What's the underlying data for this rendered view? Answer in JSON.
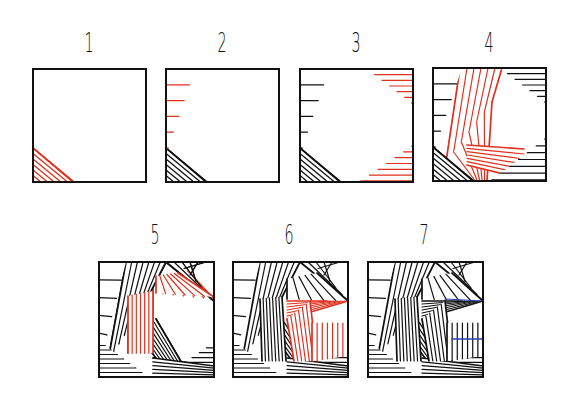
{
  "colors": {
    "ink": "#111111",
    "new_stroke": "#e0301e",
    "accent_blue": "#2a3fb0",
    "background": "#ffffff"
  },
  "steps": [
    {
      "label": "1",
      "box": [
        32,
        68,
        115,
        114
      ],
      "label_x": 89,
      "label_y": 30
    },
    {
      "label": "2",
      "box": [
        165,
        68,
        115,
        114
      ],
      "label_x": 222,
      "label_y": 30
    },
    {
      "label": "3",
      "box": [
        299,
        68,
        115,
        114
      ],
      "label_x": 356,
      "label_y": 30
    },
    {
      "label": "4",
      "box": [
        432,
        67,
        114,
        114
      ],
      "label_x": 489,
      "label_y": 30
    },
    {
      "label": "5",
      "box": [
        98,
        261,
        116,
        116
      ],
      "label_x": 155,
      "label_y": 222
    },
    {
      "label": "6",
      "box": [
        232,
        261,
        116,
        116
      ],
      "label_x": 289,
      "label_y": 222
    },
    {
      "label": "7",
      "box": [
        367,
        261,
        116,
        116
      ],
      "label_x": 424,
      "label_y": 222
    }
  ]
}
